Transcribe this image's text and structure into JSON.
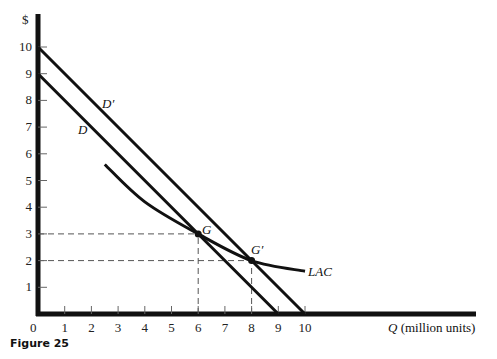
{
  "chart_data": {
    "type": "line",
    "title": "",
    "caption": "Figure 25",
    "xlabel": "Q (million units)",
    "xlabel_var": "Q",
    "xlabel_unit": " (million units)",
    "ylabel": "$",
    "xlim": [
      0,
      17
    ],
    "ylim": [
      0,
      10.5
    ],
    "x_ticks": [
      1,
      2,
      3,
      4,
      5,
      6,
      7,
      8,
      9,
      10
    ],
    "y_ticks": [
      1,
      2,
      3,
      4,
      5,
      6,
      7,
      8,
      9,
      10
    ],
    "origin_label": "0",
    "series": [
      {
        "name": "D",
        "type": "line",
        "points": [
          [
            0,
            9
          ],
          [
            9,
            0
          ]
        ]
      },
      {
        "name": "D′",
        "type": "line",
        "points": [
          [
            0,
            10
          ],
          [
            10,
            0
          ]
        ]
      },
      {
        "name": "LAC",
        "type": "curve",
        "points": [
          [
            2.5,
            5.6
          ],
          [
            4,
            4.2
          ],
          [
            6,
            3
          ],
          [
            8,
            2
          ],
          [
            10,
            1.6
          ]
        ]
      }
    ],
    "points": [
      {
        "label": "G",
        "x": 6,
        "y": 3
      },
      {
        "label": "G′",
        "x": 8,
        "y": 2
      }
    ],
    "guides": [
      {
        "from": [
          0,
          3
        ],
        "to": [
          6,
          3
        ]
      },
      {
        "from": [
          6,
          0
        ],
        "to": [
          6,
          3
        ]
      },
      {
        "from": [
          0,
          2
        ],
        "to": [
          8,
          2
        ]
      },
      {
        "from": [
          8,
          0
        ],
        "to": [
          8,
          2
        ]
      }
    ],
    "grid": false
  },
  "labels": {
    "D": "D",
    "Dprime": "D′",
    "LAC": "LAC",
    "G": "G",
    "Gprime": "G′",
    "dollar": "$",
    "zero": "0",
    "q_var": "Q",
    "q_unit": " (million units)",
    "caption": "Figure 25"
  }
}
